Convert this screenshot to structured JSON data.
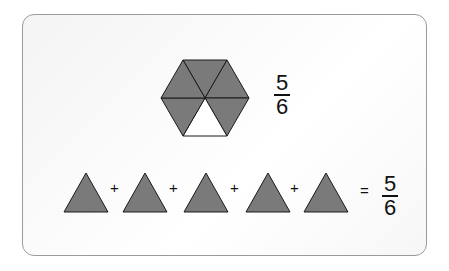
{
  "hexagon": {
    "shaded_pieces": 5,
    "total_pieces": 6,
    "fill_color": "#7a7a7a",
    "stroke_color": "#1a1a1a",
    "unshaded_color": "#ffffff"
  },
  "top_fraction": {
    "numerator": "5",
    "denominator": "6"
  },
  "equation": {
    "triangles": 5,
    "plus": "+",
    "equals": "=",
    "result": {
      "numerator": "5",
      "denominator": "6"
    }
  }
}
